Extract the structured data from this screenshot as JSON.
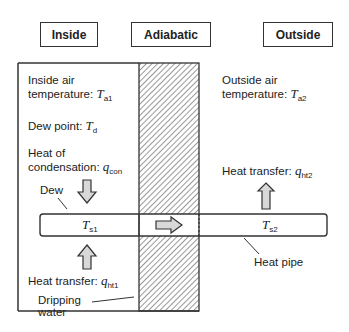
{
  "headers": {
    "inside": "Inside",
    "adiabatic": "Adiabatic",
    "outside": "Outside"
  },
  "inside": {
    "air_temp_line1": "Inside air",
    "air_temp_line2": "temperature: ",
    "air_temp_symbol": "T",
    "air_temp_sub": "a1",
    "dew_point_label": "Dew point: ",
    "dew_point_symbol": "T",
    "dew_point_sub": "d",
    "heat_cond_line1": "Heat of",
    "heat_cond_line2": "condensation: ",
    "heat_cond_symbol": "q",
    "heat_cond_sub": "con",
    "dew_label": "Dew",
    "pipe_temp_symbol": "T",
    "pipe_temp_sub": "s1",
    "heat_transfer_label": "Heat transfer: ",
    "heat_transfer_symbol": "q",
    "heat_transfer_sub": "ht1",
    "dripping_line1": "Dripping",
    "dripping_line2": "water"
  },
  "outside": {
    "air_temp_line1": "Outside air",
    "air_temp_line2": "temperature: ",
    "air_temp_symbol": "T",
    "air_temp_sub": "a2",
    "heat_transfer_label": "Heat transfer: ",
    "heat_transfer_symbol": "q",
    "heat_transfer_sub": "ht2",
    "pipe_temp_symbol": "T",
    "pipe_temp_sub": "s2",
    "heat_pipe_label": "Heat pipe"
  },
  "colors": {
    "line": "#333333",
    "arrow_fill": "#d8d8d8",
    "hatch": "#444444"
  }
}
